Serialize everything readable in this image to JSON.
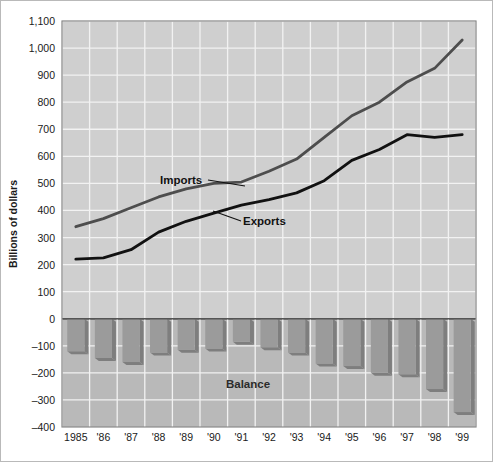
{
  "chart_data": {
    "type": "line",
    "title": "",
    "xlabel": "",
    "ylabel": "Billions of dollars",
    "ylim": [
      -400,
      1100
    ],
    "ytick_step": 100,
    "grid": true,
    "legend": "inline-annotations",
    "x": [
      "1985",
      "1986",
      "1987",
      "1988",
      "1989",
      "1990",
      "1991",
      "1992",
      "1993",
      "1994",
      "1995",
      "1996",
      "1997",
      "1998",
      "1999"
    ],
    "xtick_labels": [
      "1985",
      "'86",
      "'87",
      "'88",
      "'89",
      "'90",
      "'91",
      "'92",
      "'93",
      "'94",
      "'95",
      "'96",
      "'97",
      "'98",
      "'99"
    ],
    "ytick_labels": [
      "1,100",
      "1,000",
      "900",
      "800",
      "700",
      "600",
      "500",
      "400",
      "300",
      "200",
      "100",
      "0",
      "-100",
      "-200",
      "-300",
      "-400"
    ],
    "ytick_values": [
      1100,
      1000,
      900,
      800,
      700,
      600,
      500,
      400,
      300,
      200,
      100,
      0,
      -100,
      -200,
      -300,
      -400
    ],
    "series": [
      {
        "name": "Imports",
        "color": "#4d4d4d",
        "values": [
          340,
          370,
          410,
          450,
          480,
          500,
          505,
          545,
          590,
          670,
          750,
          800,
          875,
          925,
          1030
        ]
      },
      {
        "name": "Exports",
        "color": "#111111",
        "values": [
          220,
          225,
          255,
          320,
          360,
          390,
          420,
          440,
          465,
          510,
          585,
          625,
          680,
          670,
          680
        ]
      },
      {
        "name": "Balance",
        "type": "bar",
        "color": "#9b9b9b",
        "values": [
          -120,
          -145,
          -160,
          -125,
          -115,
          -110,
          -85,
          -105,
          -125,
          -165,
          -175,
          -200,
          -205,
          -260,
          -345
        ]
      }
    ],
    "annotations": [
      {
        "label": "Imports",
        "x_frac": 0.315,
        "y_value": 545
      },
      {
        "label": "Exports",
        "x_frac": 0.5,
        "y_value": 400
      },
      {
        "label": "Balance",
        "x_frac": 0.45,
        "y_value": -265
      }
    ]
  },
  "axis": {
    "y_title": "Billions of dollars"
  },
  "colors": {
    "plot_background": "#cfcfcf",
    "negative_panel": "#b9b9b9",
    "gridline": "#f2f2f2",
    "bar_fill": "#9b9b9b",
    "bar_shadow": "#7e7e7e",
    "imports_line": "#4d4d4d",
    "exports_line": "#111111",
    "frame": "#b9b9b9",
    "axis_text": "#1a1a1a"
  }
}
